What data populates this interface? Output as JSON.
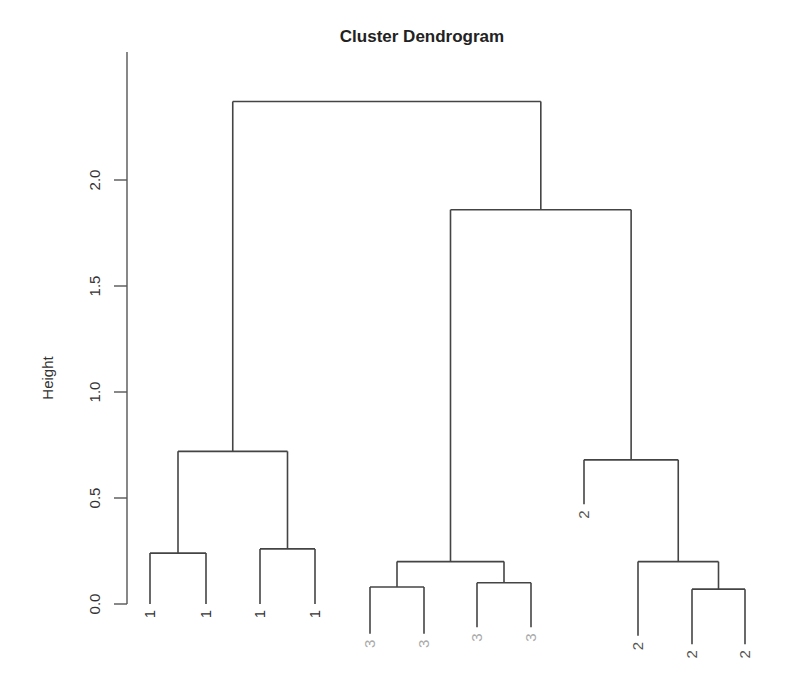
{
  "chart_data": {
    "type": "dendrogram",
    "title": "Cluster Dendrogram",
    "xlabel": "",
    "ylabel": "Height",
    "ylim": [
      0,
      2.4
    ],
    "yticks": [
      0.0,
      0.5,
      1.0,
      1.5,
      2.0
    ],
    "ytick_labels": [
      "0.0",
      "0.5",
      "1.0",
      "1.5",
      "2.0"
    ],
    "grid": false,
    "leaves": [
      {
        "label": "1",
        "color": "#333333"
      },
      {
        "label": "1",
        "color": "#333333"
      },
      {
        "label": "1",
        "color": "#333333"
      },
      {
        "label": "1",
        "color": "#333333"
      },
      {
        "label": "3",
        "color": "#aaaaaa"
      },
      {
        "label": "3",
        "color": "#aaaaaa"
      },
      {
        "label": "3",
        "color": "#aaaaaa"
      },
      {
        "label": "3",
        "color": "#aaaaaa"
      },
      {
        "label": "2",
        "color": "#555555"
      },
      {
        "label": "2",
        "color": "#555555"
      },
      {
        "label": "2",
        "color": "#555555"
      },
      {
        "label": "2",
        "color": "#555555"
      }
    ],
    "merges": [
      {
        "id": "a",
        "left": 0,
        "right": 1,
        "height": 0.24
      },
      {
        "id": "b",
        "left": 2,
        "right": 3,
        "height": 0.26
      },
      {
        "id": "c",
        "left": "a",
        "right": "b",
        "height": 0.72
      },
      {
        "id": "d",
        "left": 4,
        "right": 5,
        "height": 0.08
      },
      {
        "id": "e",
        "left": 6,
        "right": 7,
        "height": 0.1
      },
      {
        "id": "f",
        "left": "d",
        "right": "e",
        "height": 0.2
      },
      {
        "id": "g",
        "left": 10,
        "right": 11,
        "height": 0.07
      },
      {
        "id": "h",
        "left": 9,
        "right": "g",
        "height": 0.2
      },
      {
        "id": "i",
        "left": 8,
        "right": "h",
        "height": 0.68
      },
      {
        "id": "j",
        "left": "f",
        "right": "i",
        "height": 1.86
      },
      {
        "id": "k",
        "left": "c",
        "right": "j",
        "height": 2.37
      }
    ],
    "leaf_heights": [
      0.0,
      0.0,
      0.0,
      0.0,
      -0.14,
      -0.14,
      -0.11,
      -0.11,
      0.47,
      -0.15,
      -0.19,
      -0.19
    ],
    "colors": {
      "line": "#444444",
      "axis": "#555555",
      "title": "#222222"
    }
  }
}
